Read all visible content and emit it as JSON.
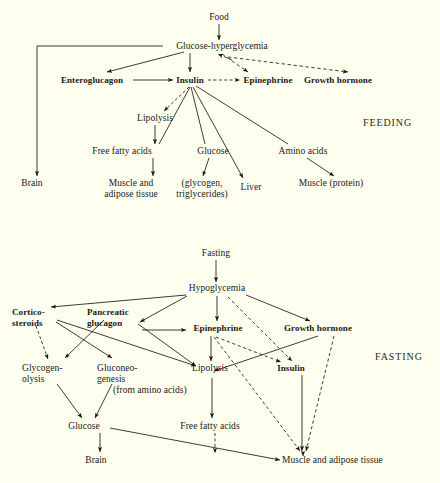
{
  "figure": {
    "background_color": "#fffff0",
    "ink_color": "#191915",
    "width": 440,
    "height": 483
  },
  "panels": [
    {
      "id": "feeding",
      "phase_label": "FEEDING",
      "nodes": [
        {
          "id": "food",
          "label": "Food",
          "bold": false,
          "x": 219,
          "y": 17,
          "w": 34,
          "lines": 1
        },
        {
          "id": "glucose-hyper",
          "label": "Glucose-hyperglycemia",
          "bold": false,
          "x": 222,
          "y": 46,
          "w": 118,
          "lines": 1
        },
        {
          "id": "enteroglucagon",
          "label": "Enteroglucagon",
          "bold": true,
          "x": 92,
          "y": 80,
          "w": 76,
          "lines": 1
        },
        {
          "id": "insulin",
          "label": "Insulin",
          "bold": true,
          "x": 190,
          "y": 80,
          "w": 34,
          "lines": 1
        },
        {
          "id": "epinephrine",
          "label": "Epinephrine",
          "bold": true,
          "x": 268,
          "y": 80,
          "w": 58,
          "lines": 1
        },
        {
          "id": "growth-hormone",
          "label": "Growth hormone",
          "bold": true,
          "x": 338,
          "y": 80,
          "w": 72,
          "lines": 1
        },
        {
          "id": "lipolysis",
          "label": "Lipolysis",
          "bold": false,
          "x": 155,
          "y": 118,
          "w": 42,
          "lines": 1
        },
        {
          "id": "free-fatty-acids",
          "label": "Free fatty acids",
          "bold": false,
          "x": 122,
          "y": 151,
          "w": 66,
          "lines": 1
        },
        {
          "id": "glucose",
          "label": "Glucose",
          "bold": false,
          "x": 213,
          "y": 151,
          "w": 38,
          "lines": 1
        },
        {
          "id": "amino-acids",
          "label": "Amino acids",
          "bold": false,
          "x": 303,
          "y": 151,
          "w": 54,
          "lines": 1
        },
        {
          "id": "brain",
          "label": "Brain",
          "bold": false,
          "x": 32,
          "y": 183,
          "w": 26,
          "lines": 1
        },
        {
          "id": "muscle-adipose",
          "label": "Muscle and\nadipose tissue",
          "bold": false,
          "x": 131,
          "y": 183,
          "w": 62,
          "lines": 2
        },
        {
          "id": "glycogen-tri",
          "label": "(glycogen,\ntriglycerides)",
          "bold": false,
          "x": 202,
          "y": 183,
          "w": 58,
          "lines": 2
        },
        {
          "id": "liver",
          "label": "Liver",
          "bold": false,
          "x": 251,
          "y": 187,
          "w": 26,
          "lines": 1
        },
        {
          "id": "muscle-protein",
          "label": "Muscle (protein)",
          "bold": false,
          "x": 331,
          "y": 183,
          "w": 72,
          "lines": 1
        }
      ],
      "edges": [
        {
          "from": "food",
          "to": "glucose-hyper",
          "style": "solid",
          "arrow": true
        },
        {
          "from": "glucose-hyper",
          "to": "enteroglucagon",
          "style": "solid",
          "arrow": true
        },
        {
          "from": "glucose-hyper",
          "to": "insulin",
          "style": "solid",
          "arrow": true
        },
        {
          "from": "glucose-hyper",
          "to": "epinephrine",
          "style": "dashed",
          "arrow": true
        },
        {
          "from": "glucose-hyper",
          "to": "growth-hormone",
          "style": "dashed",
          "arrow": true
        },
        {
          "from": "epinephrine",
          "to": "glucose-hyper",
          "style": "dashed",
          "arrow": true
        },
        {
          "from": "glucose-hyper",
          "to": "brain",
          "style": "solid",
          "arrow": true,
          "route": "elbow-left"
        },
        {
          "from": "enteroglucagon",
          "to": "insulin",
          "style": "solid",
          "arrow": true
        },
        {
          "from": "insulin",
          "to": "epinephrine",
          "style": "dashed",
          "arrow": true
        },
        {
          "from": "insulin",
          "to": "lipolysis",
          "style": "dashed",
          "arrow": true
        },
        {
          "from": "insulin",
          "to": "free-fatty-acids",
          "style": "solid",
          "arrow": false
        },
        {
          "from": "insulin",
          "to": "glucose",
          "style": "solid",
          "arrow": false
        },
        {
          "from": "insulin",
          "to": "liver",
          "style": "solid",
          "arrow": true
        },
        {
          "from": "insulin",
          "to": "amino-acids",
          "style": "solid",
          "arrow": false
        },
        {
          "from": "lipolysis",
          "to": "free-fatty-acids",
          "style": "solid",
          "arrow": true
        },
        {
          "from": "free-fatty-acids",
          "to": "muscle-adipose",
          "style": "solid",
          "arrow": true
        },
        {
          "from": "glucose",
          "to": "glycogen-tri",
          "style": "solid",
          "arrow": true
        },
        {
          "from": "amino-acids",
          "to": "muscle-protein",
          "style": "solid",
          "arrow": true
        }
      ]
    },
    {
      "id": "fasting",
      "phase_label": "FASTING",
      "nodes": [
        {
          "id": "fasting",
          "label": "Fasting",
          "bold": false,
          "x": 216,
          "y": 253,
          "w": 40,
          "lines": 1
        },
        {
          "id": "hypoglycemia",
          "label": "Hypoglycemia",
          "bold": false,
          "x": 217,
          "y": 288,
          "w": 66,
          "lines": 1
        },
        {
          "id": "cortico-steroids",
          "label": "Cortico-\nsteroids",
          "bold": true,
          "x": 34,
          "y": 312,
          "w": 44,
          "lines": 2
        },
        {
          "id": "pancreatic-glucagon",
          "label": "Pancreatic\nglucagon",
          "bold": true,
          "x": 113,
          "y": 312,
          "w": 52,
          "lines": 2
        },
        {
          "id": "epinephrine-f",
          "label": "Epinephrine",
          "bold": true,
          "x": 218,
          "y": 328,
          "w": 60,
          "lines": 1
        },
        {
          "id": "growth-hormone-f",
          "label": "Growth hormone",
          "bold": true,
          "x": 318,
          "y": 328,
          "w": 70,
          "lines": 1
        },
        {
          "id": "glycogenolysis",
          "label": "Glycogen-\nolysis",
          "bold": false,
          "x": 46,
          "y": 368,
          "w": 48,
          "lines": 2
        },
        {
          "id": "gluconeogenesis",
          "label": "Gluconeo-\ngenesis",
          "bold": false,
          "x": 120,
          "y": 368,
          "w": 46,
          "lines": 2
        },
        {
          "id": "from-amino-acids",
          "label": "(from amino acids)",
          "bold": false,
          "x": 153,
          "y": 390,
          "w": 80,
          "lines": 1
        },
        {
          "id": "lipolysis-f",
          "label": "Lipolysis",
          "bold": false,
          "x": 210,
          "y": 368,
          "w": 42,
          "lines": 1
        },
        {
          "id": "insulin-f",
          "label": "Insulin",
          "bold": true,
          "x": 291,
          "y": 368,
          "w": 34,
          "lines": 1
        },
        {
          "id": "glucose-f",
          "label": "Glucose",
          "bold": false,
          "x": 84,
          "y": 426,
          "w": 40,
          "lines": 1
        },
        {
          "id": "free-fatty-acids-f",
          "label": "Free fatty acids",
          "bold": false,
          "x": 210,
          "y": 426,
          "w": 66,
          "lines": 1
        },
        {
          "id": "brain-f",
          "label": "Brain",
          "bold": false,
          "x": 96,
          "y": 460,
          "w": 26,
          "lines": 1
        },
        {
          "id": "muscle-adipose-f",
          "label": "Muscle and adipose tissue",
          "bold": false,
          "x": 338,
          "y": 460,
          "w": 112,
          "lines": 1
        }
      ],
      "edges": [
        {
          "from": "fasting",
          "to": "hypoglycemia",
          "style": "solid",
          "arrow": true
        },
        {
          "from": "hypoglycemia",
          "to": "cortico-steroids",
          "style": "solid",
          "arrow": true
        },
        {
          "from": "hypoglycemia",
          "to": "pancreatic-glucagon",
          "style": "solid",
          "arrow": true
        },
        {
          "from": "hypoglycemia",
          "to": "epinephrine-f",
          "style": "solid",
          "arrow": true
        },
        {
          "from": "hypoglycemia",
          "to": "growth-hormone-f",
          "style": "solid",
          "arrow": true
        },
        {
          "from": "hypoglycemia",
          "to": "insulin-f",
          "style": "dashed",
          "arrow": true
        },
        {
          "from": "cortico-steroids",
          "to": "glycogenolysis",
          "style": "dashed",
          "arrow": true
        },
        {
          "from": "cortico-steroids",
          "to": "gluconeogenesis",
          "style": "solid",
          "arrow": true
        },
        {
          "from": "cortico-steroids",
          "to": "lipolysis-f",
          "style": "solid",
          "arrow": true
        },
        {
          "from": "pancreatic-glucagon",
          "to": "glycogenolysis",
          "style": "solid",
          "arrow": true
        },
        {
          "from": "pancreatic-glucagon",
          "to": "epinephrine-f",
          "style": "solid",
          "arrow": true
        },
        {
          "from": "pancreatic-glucagon",
          "to": "lipolysis-f",
          "style": "solid",
          "arrow": true
        },
        {
          "from": "epinephrine-f",
          "to": "lipolysis-f",
          "style": "solid",
          "arrow": true
        },
        {
          "from": "epinephrine-f",
          "to": "insulin-f",
          "style": "dashed",
          "arrow": true
        },
        {
          "from": "epinephrine-f",
          "to": "muscle-adipose-f",
          "style": "dashed",
          "arrow": true
        },
        {
          "from": "growth-hormone-f",
          "to": "lipolysis-f",
          "style": "solid",
          "arrow": true
        },
        {
          "from": "growth-hormone-f",
          "to": "muscle-adipose-f",
          "style": "dashed",
          "arrow": true
        },
        {
          "from": "insulin-f",
          "to": "muscle-adipose-f",
          "style": "solid",
          "arrow": true
        },
        {
          "from": "glycogenolysis",
          "to": "glucose-f",
          "style": "solid",
          "arrow": true
        },
        {
          "from": "gluconeogenesis",
          "to": "glucose-f",
          "style": "solid",
          "arrow": true
        },
        {
          "from": "lipolysis-f",
          "to": "free-fatty-acids-f",
          "style": "solid",
          "arrow": true
        },
        {
          "from": "free-fatty-acids-f",
          "to": "glucose-muscle-line",
          "style": "dashed",
          "arrow": true
        },
        {
          "from": "glucose-f",
          "to": "brain-f",
          "style": "solid",
          "arrow": true
        },
        {
          "from": "glucose-f",
          "to": "muscle-adipose-f",
          "style": "solid",
          "arrow": true
        }
      ]
    }
  ]
}
